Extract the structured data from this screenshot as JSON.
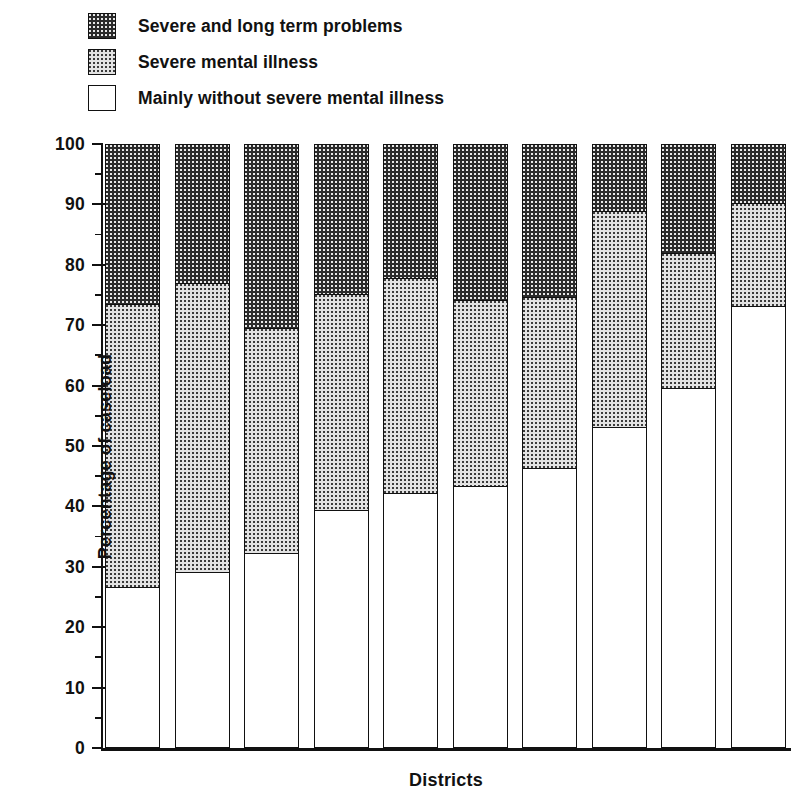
{
  "chart_data": {
    "type": "bar",
    "subtype": "stacked-percentage",
    "title": "",
    "xlabel": "Districts",
    "ylabel": "Percentage of caseload",
    "ylim": [
      0,
      100
    ],
    "ytick_step": 10,
    "ytick_minor_step": 5,
    "grid": false,
    "legend_position": "top-left",
    "categories": [
      "1",
      "2",
      "3",
      "4",
      "5",
      "6",
      "7",
      "8",
      "9",
      "10"
    ],
    "series": [
      {
        "name": "Mainly without severe mental illness",
        "swatch": "white",
        "color": "#ffffff",
        "values": [
          26.7,
          29.1,
          32.3,
          39.4,
          42.2,
          43.4,
          46.4,
          53.1,
          59.6,
          73.2
        ]
      },
      {
        "name": "Severe mental illness",
        "swatch": "grey-dotted",
        "color": "#e2e2e2",
        "values": [
          46.8,
          47.9,
          37.2,
          35.8,
          35.6,
          30.8,
          28.3,
          35.8,
          22.4,
          17.0
        ]
      },
      {
        "name": "Severe and long term problems",
        "swatch": "dark-dotted",
        "color": "#2b2b2b",
        "values": [
          26.5,
          23.0,
          30.5,
          24.8,
          22.2,
          25.8,
          25.3,
          11.1,
          18.0,
          9.8
        ]
      }
    ],
    "cumulative_boundaries": {
      "white_top": [
        26.7,
        29.1,
        32.3,
        39.4,
        42.2,
        43.4,
        46.4,
        53.1,
        59.6,
        73.2
      ],
      "grey_top": [
        73.5,
        77.0,
        69.5,
        75.2,
        77.8,
        74.2,
        74.7,
        88.9,
        82.0,
        90.2
      ],
      "dark_top": [
        100,
        100,
        100,
        100,
        100,
        100,
        100,
        100,
        100,
        100
      ]
    },
    "ytick_labels": [
      "0",
      "10",
      "20",
      "30",
      "40",
      "50",
      "60",
      "70",
      "80",
      "90",
      "100"
    ]
  },
  "legend": {
    "items": [
      {
        "label": "Severe and long term problems",
        "swatch": "dark-dotted"
      },
      {
        "label": "Severe mental illness",
        "swatch": "grey-dotted"
      },
      {
        "label": "Mainly without severe mental illness",
        "swatch": "white"
      }
    ]
  },
  "axes": {
    "y_title": "Percentage of caseload",
    "x_title": "Districts"
  }
}
